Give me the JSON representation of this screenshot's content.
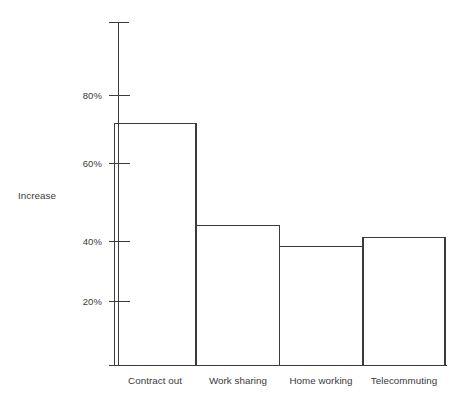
{
  "chart_data": {
    "type": "bar",
    "title": "",
    "xlabel": "",
    "ylabel": "Increase",
    "categories": [
      "Contract out",
      "Work sharing",
      "Home working",
      "Telecommuting"
    ],
    "values": [
      71,
      41,
      35,
      37.5
    ],
    "ylim": [
      0,
      100
    ],
    "ytick_values": [
      20,
      40,
      60,
      80
    ],
    "ytick_labels": [
      "20%",
      "40%",
      "60%",
      "80%"
    ],
    "grid": false,
    "legend": null,
    "series": [
      {
        "name": "Increase",
        "values": [
          71,
          41,
          35,
          37.5
        ]
      }
    ],
    "annotations": [],
    "colors": {
      "bar_fill": "#ffffff",
      "bar_stroke": "#3b3b3b",
      "axis": "#3b3b3b",
      "text": "#3a3a3a",
      "background": "#ffffff"
    }
  },
  "axis": {
    "y_title": "Increase",
    "ticks": [
      {
        "label": "80%",
        "value": 80
      },
      {
        "label": "60%",
        "value": 60
      },
      {
        "label": "40%",
        "value": 40
      },
      {
        "label": "20%",
        "value": 20
      }
    ]
  },
  "bars": [
    {
      "label": "Contract out",
      "value": 71
    },
    {
      "label": "Work sharing",
      "value": 41
    },
    {
      "label": "Home working",
      "value": 35
    },
    {
      "label": "Telecommuting",
      "value": 37.5
    }
  ]
}
